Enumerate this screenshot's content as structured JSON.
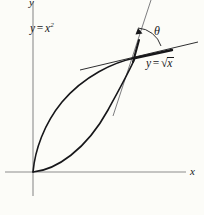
{
  "figure": {
    "background_color": "#fcfcf8",
    "ink_color": "#17171a",
    "axis_color": "#8c8c8c"
  },
  "axes": {
    "x_label": "x",
    "y_label": "y",
    "origin": {
      "x": 33,
      "y": 172
    },
    "x_axis": {
      "x1": 5,
      "y1": 172,
      "x2": 186,
      "y2": 172
    },
    "y_axis": {
      "x1": 33,
      "y1": 2,
      "x2": 33,
      "y2": 196
    }
  },
  "labels": {
    "parabola": {
      "lhs": "y",
      "op": "=",
      "base": "x",
      "exponent": "2"
    },
    "sqrt": {
      "lhs": "y",
      "op": "=",
      "radicand": "x",
      "radical_sign": "√"
    },
    "angle": "θ"
  },
  "curves": [
    {
      "name": "parabola",
      "equation": "y = x^2",
      "stroke": "#17171a",
      "stroke_width": 1.6,
      "path": "M 33 172 C 56 170 86 150 108 110 C 120 88 130 70 135 58"
    },
    {
      "name": "square-root",
      "equation": "y = sqrt(x)",
      "stroke": "#17171a",
      "stroke_width": 1.6,
      "path": "M 33 172 C 35 150 44 124 62 102 C 84 76 114 62 135 58"
    }
  ],
  "tangents": [
    {
      "name": "tangent-to-parabola",
      "stroke": "#6e6e72",
      "stroke_width": 0.9,
      "path": "M 151 0 L 113 116"
    },
    {
      "name": "tangent-to-sqrt",
      "stroke": "#17171a",
      "stroke_width": 0.9,
      "path": "M 80 70 L 198 42"
    }
  ],
  "emphasis_segments": [
    {
      "name": "tangent-parabola-highlight",
      "stroke": "#17171a",
      "stroke_width": 2.1,
      "path": "M 139 40 L 133 62"
    },
    {
      "name": "tangent-sqrt-highlight",
      "stroke": "#17171a",
      "stroke_width": 2.4,
      "path": "M 135 58 L 172 50"
    }
  ],
  "angle_arc": {
    "name": "theta-arc",
    "stroke": "#17171a",
    "stroke_width": 0.9,
    "path": "M 138 28 A 26 26 0 0 1 161 46",
    "arrowhead": "M 138 28 L 142 33 L 136 34 Z",
    "vertex": {
      "x": 135,
      "y": 58
    }
  },
  "intersection_point": {
    "x": 135,
    "y": 58
  }
}
